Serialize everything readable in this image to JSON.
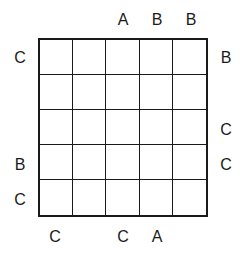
{
  "puzzle": {
    "size": 5,
    "clues": {
      "top": [
        "",
        "",
        "A",
        "B",
        "B"
      ],
      "bottom": [
        "C",
        "",
        "C",
        "A",
        ""
      ],
      "left": [
        "C",
        "",
        "",
        "B",
        "C"
      ],
      "right": [
        "B",
        "",
        "C",
        "C",
        ""
      ]
    },
    "cells": [
      [
        "",
        "",
        "",
        "",
        ""
      ],
      [
        "",
        "",
        "",
        "",
        ""
      ],
      [
        "",
        "",
        "",
        "",
        ""
      ],
      [
        "",
        "",
        "",
        "",
        ""
      ],
      [
        "",
        "",
        "",
        "",
        ""
      ]
    ]
  }
}
